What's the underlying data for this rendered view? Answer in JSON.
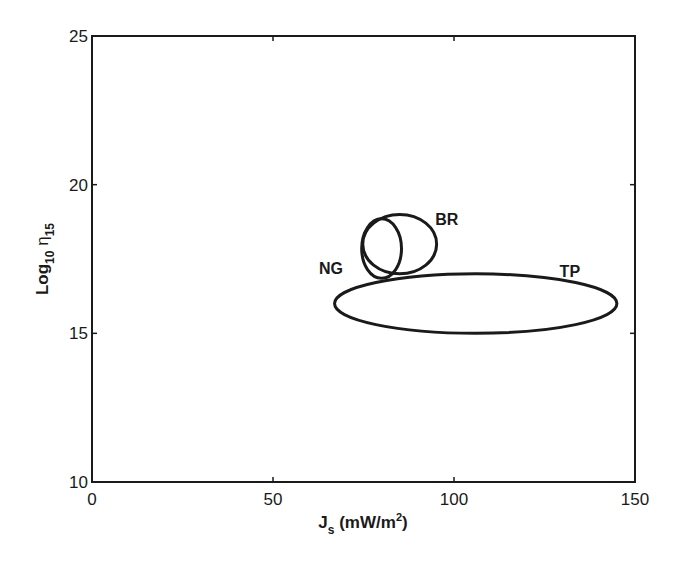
{
  "chart_data": {
    "type": "scatter",
    "subtype": "ellipse-regions",
    "title": "",
    "xlabel": "J_s (mW/m^2)",
    "xlabel_parts": {
      "main": "J",
      "sub": "s",
      "rest": " (mW/m",
      "sup": "2",
      "end": ")"
    },
    "ylabel": "Log10 η15",
    "ylabel_parts": {
      "main": "Log",
      "sub1": "10",
      "sym": " η",
      "sub2": "15"
    },
    "xlim": [
      0,
      150
    ],
    "ylim": [
      10,
      25
    ],
    "xticks": [
      0,
      50,
      100,
      150
    ],
    "yticks": [
      10,
      15,
      20,
      25
    ],
    "grid": false,
    "legend": null,
    "line_color": "#1a1a1a",
    "series": [
      {
        "name": "TP",
        "shape": "ellipse",
        "center": [
          106,
          16.0
        ],
        "radius_x": 39,
        "radius_y": 1.0,
        "label_pos": [
          132,
          17.1
        ]
      },
      {
        "name": "BR",
        "shape": "ellipse",
        "center": [
          85,
          18.0
        ],
        "radius_x": 10.2,
        "radius_y": 1.0,
        "label_pos": [
          98,
          18.85
        ]
      },
      {
        "name": "NG",
        "shape": "ellipse",
        "center": [
          80,
          17.85
        ],
        "radius_x": 5.5,
        "radius_y": 1.0,
        "label_pos": [
          66,
          17.2
        ]
      }
    ]
  }
}
